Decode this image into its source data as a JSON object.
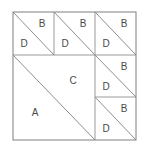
{
  "figure": {
    "background_color": "#ffffff",
    "line_color": "#8e8e8e",
    "label_color": "#4a4a4a",
    "frame": {
      "x": 13,
      "y": 12,
      "width": 123,
      "height": 128
    },
    "tiles": [
      {
        "id": "tile-top-left",
        "x": 13,
        "y": 12,
        "width": 41,
        "height": 43,
        "diagonal": "tl-br",
        "upper_label": "B",
        "lower_label": "D",
        "upper_label_x": 42,
        "upper_label_y": 24,
        "lower_label_x": 24,
        "lower_label_y": 44
      },
      {
        "id": "tile-top-middle",
        "x": 54,
        "y": 12,
        "width": 41,
        "height": 43,
        "diagonal": "tl-br",
        "upper_label": "B",
        "lower_label": "D",
        "upper_label_x": 83,
        "upper_label_y": 24,
        "lower_label_x": 65,
        "lower_label_y": 44
      },
      {
        "id": "tile-top-right",
        "x": 95,
        "y": 12,
        "width": 41,
        "height": 43,
        "diagonal": "tl-br",
        "upper_label": "B",
        "lower_label": "D",
        "upper_label_x": 124,
        "upper_label_y": 24,
        "lower_label_x": 106,
        "lower_label_y": 44
      },
      {
        "id": "tile-large-left",
        "x": 13,
        "y": 55,
        "width": 82,
        "height": 85,
        "diagonal": "tl-br",
        "upper_label": "C",
        "lower_label": "A",
        "upper_label_x": 73,
        "upper_label_y": 81,
        "lower_label_x": 35,
        "lower_label_y": 113
      },
      {
        "id": "tile-right-middle",
        "x": 95,
        "y": 55,
        "width": 41,
        "height": 42,
        "diagonal": "tl-br",
        "upper_label": "B",
        "lower_label": "D",
        "upper_label_x": 124,
        "upper_label_y": 67,
        "lower_label_x": 106,
        "lower_label_y": 87
      },
      {
        "id": "tile-right-bottom",
        "x": 95,
        "y": 97,
        "width": 41,
        "height": 43,
        "diagonal": "tl-br",
        "upper_label": "B",
        "lower_label": "D",
        "upper_label_x": 124,
        "upper_label_y": 109,
        "lower_label_x": 106,
        "lower_label_y": 129
      }
    ],
    "cuts": [
      {
        "id": "cut-vertical-1",
        "x1": 54,
        "y1": 12,
        "x2": 54,
        "y2": 55
      },
      {
        "id": "cut-vertical-2",
        "x1": 95,
        "y1": 12,
        "x2": 95,
        "y2": 140
      },
      {
        "id": "cut-horizontal-1",
        "x1": 13,
        "y1": 55,
        "x2": 136,
        "y2": 55
      },
      {
        "id": "cut-horizontal-2",
        "x1": 95,
        "y1": 97,
        "x2": 136,
        "y2": 97
      }
    ]
  }
}
